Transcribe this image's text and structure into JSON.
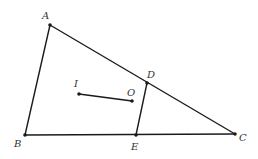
{
  "diagram": {
    "type": "geometry",
    "stroke_color": "#1a1a1a",
    "label_color": "#333333",
    "points": [
      {
        "id": "A",
        "label": "A",
        "x": 50,
        "y": 25,
        "lx": 42,
        "ly": 19
      },
      {
        "id": "B",
        "label": "B",
        "x": 25,
        "y": 135,
        "lx": 14,
        "ly": 147
      },
      {
        "id": "C",
        "label": "C",
        "x": 235,
        "y": 134,
        "lx": 239,
        "ly": 141
      },
      {
        "id": "D",
        "label": "D",
        "x": 147,
        "y": 83,
        "lx": 147,
        "ly": 78
      },
      {
        "id": "E",
        "label": "E",
        "x": 136,
        "y": 135,
        "lx": 131,
        "ly": 150
      },
      {
        "id": "I",
        "label": "I",
        "x": 79,
        "y": 94,
        "lx": 74,
        "ly": 87
      },
      {
        "id": "O",
        "label": "O",
        "x": 132,
        "y": 101,
        "lx": 127,
        "ly": 96
      }
    ],
    "segments": [
      {
        "from": "A",
        "to": "B"
      },
      {
        "from": "A",
        "to": "C"
      },
      {
        "from": "B",
        "to": "C"
      },
      {
        "from": "D",
        "to": "E"
      },
      {
        "from": "I",
        "to": "O"
      }
    ]
  }
}
